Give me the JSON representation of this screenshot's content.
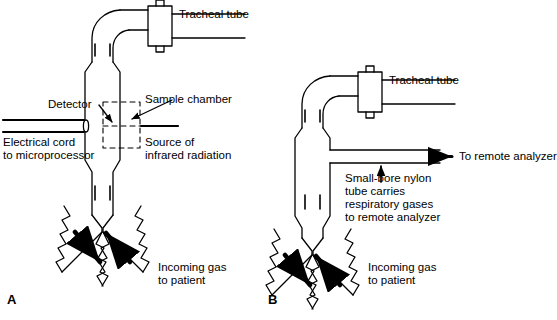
{
  "figure": {
    "background_color": "#ffffff",
    "line_color": "#000000"
  },
  "panels": [
    {
      "id": "A",
      "letter": "A",
      "name": "mainstream-capnograph",
      "labels": {
        "tracheal_tube": "Tracheal tube",
        "detector": "Detector",
        "electrical_cord": "Electrical cord\nto microprocessor",
        "sample_chamber": "Sample chamber",
        "ir_source": "Source of\ninfrared radiation",
        "incoming_gas": "Incoming gas\nto patient"
      }
    },
    {
      "id": "B",
      "letter": "B",
      "name": "sidestream-capnograph",
      "labels": {
        "tracheal_tube": "Tracheal tube",
        "to_remote_analyzer": "To remote analyzer",
        "nylon_tube": "Small-bore nylon\ntube carries\nrespiratory gases\nto remote analyzer",
        "incoming_gas": "Incoming gas\nto patient"
      }
    }
  ]
}
